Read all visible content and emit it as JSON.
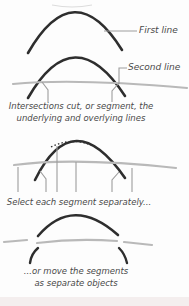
{
  "colors": {
    "stroke_dark": "#2e2e2e",
    "stroke_light": "#b9b9b9",
    "leader": "#9d9d9d",
    "remnant": "#dcdcdc",
    "text": "#4a4a4a",
    "background": "#fdfdfd",
    "footer_strip": "#f4eeee"
  },
  "labels": {
    "first_line": "First line",
    "second_line": "Second line"
  },
  "captions": {
    "intersections_line1": "Intersections cut, or segment, the",
    "intersections_line2": "underlying and overlying lines",
    "select": "Select each segment separately...",
    "move_line1": "...or move the segments",
    "move_line2": "as separate objects"
  }
}
